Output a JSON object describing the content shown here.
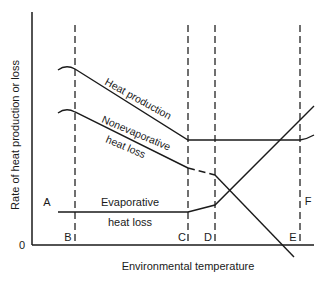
{
  "diagram": {
    "y_axis_label": "Rate of heat production or loss",
    "x_axis_label": "Environmental temperature",
    "origin_label": "0",
    "zone_labels": {
      "A": "A",
      "B": "B",
      "C": "C",
      "D": "D",
      "E": "E",
      "F": "F"
    },
    "curves": {
      "heat_production": "Heat production",
      "nonevaporative_line1": "Nonevaporative",
      "nonevaporative_line2": "heat loss",
      "evaporative_line1": "Evaporative",
      "evaporative_line2": "heat loss"
    },
    "colors": {
      "line": "#1a1a1a",
      "dashed": "#333333",
      "background": "#ffffff"
    }
  }
}
